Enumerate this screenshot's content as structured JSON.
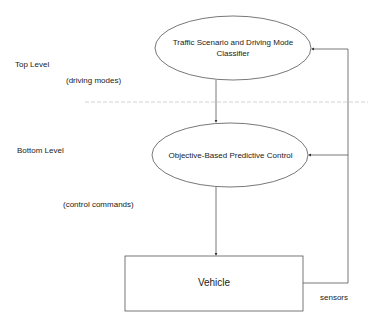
{
  "diagram": {
    "levels": {
      "top": "Top Level",
      "bottom": "Bottom Level"
    },
    "nodes": {
      "classifier": {
        "line1": "Traffic Scenario and Driving Mode",
        "line2": "Classifier"
      },
      "controller": "Objective-Based Predictive Control",
      "vehicle": "Vehicle"
    },
    "edge_labels": {
      "driving_modes": "(driving modes)",
      "control_commands": "(control commands)",
      "sensors": "sensors"
    },
    "colors": {
      "stroke": "#555555",
      "separator": "#c8c8c8",
      "text": "#222222",
      "background": "#ffffff"
    }
  }
}
